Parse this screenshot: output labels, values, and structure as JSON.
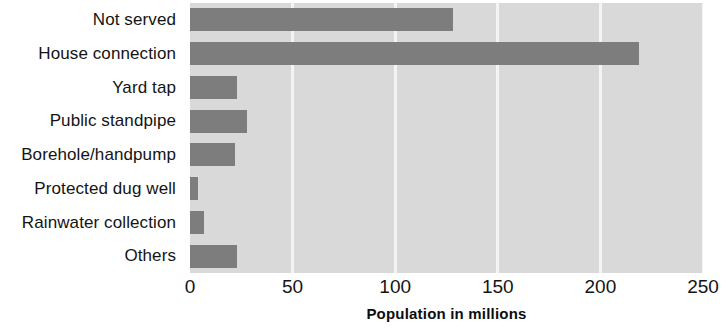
{
  "chart_data": {
    "type": "bar",
    "orientation": "horizontal",
    "title": "",
    "xlabel": "Population in millions",
    "ylabel": "",
    "categories": [
      "Not served",
      "House connection",
      "Yard tap",
      "Public standpipe",
      "Borehole/handpump",
      "Protected dug well",
      "Rainwater collection",
      "Others"
    ],
    "values": [
      128,
      219,
      23,
      28,
      22,
      4,
      7,
      23
    ],
    "xlim": [
      0,
      250
    ],
    "xticks": [
      0,
      50,
      100,
      150,
      200,
      250
    ],
    "xtick_labels": [
      "0",
      "50",
      "100",
      "150",
      "200",
      "250"
    ],
    "grid": true,
    "grid_axis": "x",
    "legend": "none",
    "colors": {
      "bar": "#7d7d7d",
      "plot_background": "#d9d9d9",
      "gridline": "#f4f4f4",
      "figure_background": "#ffffff",
      "text": "#141414"
    }
  }
}
